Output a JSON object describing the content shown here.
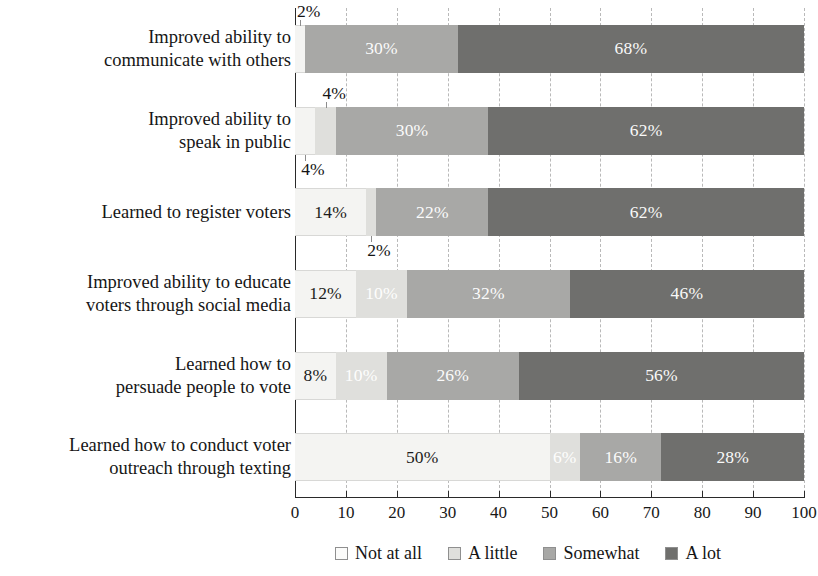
{
  "chart_data": {
    "type": "bar",
    "orientation": "horizontal",
    "stacked": true,
    "title": "",
    "xlabel": "",
    "ylabel": "",
    "xlim": [
      0,
      100
    ],
    "xticks": [
      "0",
      "10",
      "20",
      "30",
      "40",
      "50",
      "60",
      "70",
      "80",
      "90",
      "100"
    ],
    "grid": "vertical-dashed",
    "legend_position": "bottom-right",
    "categories": [
      "Improved ability to\ncommunicate with others",
      "Improved ability to\nspeak in public",
      "Learned to register voters",
      "Improved ability to educate\nvoters through social media",
      "Learned how to\npersuade people to vote",
      "Learned how to conduct voter\noutreach through texting"
    ],
    "series": [
      {
        "name": "Not at all",
        "color": "#f4f4f2",
        "values": [
          2,
          4,
          14,
          12,
          8,
          50
        ]
      },
      {
        "name": "A little",
        "color": "#dfdfdc",
        "values": [
          0,
          4,
          2,
          10,
          10,
          6
        ]
      },
      {
        "name": "Somewhat",
        "color": "#a8a8a6",
        "values": [
          30,
          30,
          22,
          32,
          26,
          16
        ]
      },
      {
        "name": "A lot",
        "color": "#6f6f6d",
        "values": [
          68,
          62,
          62,
          46,
          56,
          28
        ]
      }
    ],
    "data_labels": [
      {
        "row": 0,
        "series": "Not at all",
        "text": "2%",
        "placement": "outside-above"
      },
      {
        "row": 0,
        "series": "Somewhat",
        "text": "30%",
        "placement": "inside"
      },
      {
        "row": 0,
        "series": "A lot",
        "text": "68%",
        "placement": "inside"
      },
      {
        "row": 1,
        "series": "Not at all",
        "text": "4%",
        "placement": "outside-below"
      },
      {
        "row": 1,
        "series": "A little",
        "text": "4%",
        "placement": "outside-above"
      },
      {
        "row": 1,
        "series": "Somewhat",
        "text": "30%",
        "placement": "inside"
      },
      {
        "row": 1,
        "series": "A lot",
        "text": "62%",
        "placement": "inside"
      },
      {
        "row": 2,
        "series": "Not at all",
        "text": "14%",
        "placement": "inside"
      },
      {
        "row": 2,
        "series": "A little",
        "text": "2%",
        "placement": "outside-below"
      },
      {
        "row": 2,
        "series": "Somewhat",
        "text": "22%",
        "placement": "inside"
      },
      {
        "row": 2,
        "series": "A lot",
        "text": "62%",
        "placement": "inside"
      },
      {
        "row": 3,
        "series": "Not at all",
        "text": "12%",
        "placement": "inside"
      },
      {
        "row": 3,
        "series": "A little",
        "text": "10%",
        "placement": "inside"
      },
      {
        "row": 3,
        "series": "Somewhat",
        "text": "32%",
        "placement": "inside"
      },
      {
        "row": 3,
        "series": "A lot",
        "text": "46%",
        "placement": "inside"
      },
      {
        "row": 4,
        "series": "Not at all",
        "text": "8%",
        "placement": "inside"
      },
      {
        "row": 4,
        "series": "A little",
        "text": "10%",
        "placement": "inside"
      },
      {
        "row": 4,
        "series": "Somewhat",
        "text": "26%",
        "placement": "inside"
      },
      {
        "row": 4,
        "series": "A lot",
        "text": "56%",
        "placement": "inside"
      },
      {
        "row": 5,
        "series": "Not at all",
        "text": "50%",
        "placement": "inside"
      },
      {
        "row": 5,
        "series": "A little",
        "text": "6%",
        "placement": "inside"
      },
      {
        "row": 5,
        "series": "Somewhat",
        "text": "16%",
        "placement": "inside"
      },
      {
        "row": 5,
        "series": "A lot",
        "text": "28%",
        "placement": "inside"
      }
    ]
  },
  "legend": {
    "items": [
      {
        "label": "Not at all",
        "swatch": "sw-notatall"
      },
      {
        "label": "A little",
        "swatch": "sw-alittle"
      },
      {
        "label": "Somewhat",
        "swatch": "sw-somewhat"
      },
      {
        "label": "A lot",
        "swatch": "sw-alot"
      }
    ]
  }
}
